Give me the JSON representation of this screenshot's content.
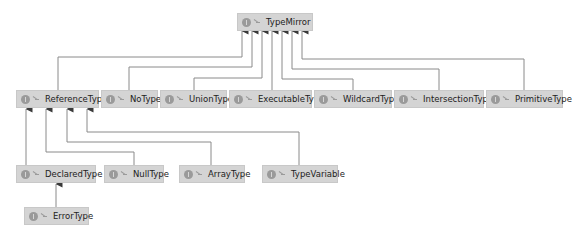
{
  "diagram": {
    "type": "class-hierarchy",
    "node_icon": "interface-icon",
    "visibility_icon": "public-visibility-icon",
    "colors": {
      "node_fill": "#d4d4d4",
      "node_border": "#c8c8c8",
      "edge": "#8a8a8a",
      "arrow": "#3a3a3a",
      "text": "#222222",
      "background": "#ffffff"
    },
    "nodes": {
      "typemirror": {
        "label": "TypeMirror"
      },
      "referencetype": {
        "label": "ReferenceType"
      },
      "notype": {
        "label": "NoType"
      },
      "uniontype": {
        "label": "UnionType"
      },
      "executabletype": {
        "label": "ExecutableType"
      },
      "wildcardtype": {
        "label": "WildcardType"
      },
      "intersectiontype": {
        "label": "IntersectionType"
      },
      "primitivetype": {
        "label": "PrimitiveType"
      },
      "declaredtype": {
        "label": "DeclaredType"
      },
      "nulltype": {
        "label": "NullType"
      },
      "arraytype": {
        "label": "ArrayType"
      },
      "typevariable": {
        "label": "TypeVariable"
      },
      "errortype": {
        "label": "ErrorType"
      }
    },
    "edges": [
      {
        "from": "ReferenceType",
        "to": "TypeMirror"
      },
      {
        "from": "NoType",
        "to": "TypeMirror"
      },
      {
        "from": "UnionType",
        "to": "TypeMirror"
      },
      {
        "from": "ExecutableType",
        "to": "TypeMirror"
      },
      {
        "from": "WildcardType",
        "to": "TypeMirror"
      },
      {
        "from": "IntersectionType",
        "to": "TypeMirror"
      },
      {
        "from": "PrimitiveType",
        "to": "TypeMirror"
      },
      {
        "from": "DeclaredType",
        "to": "ReferenceType"
      },
      {
        "from": "NullType",
        "to": "ReferenceType"
      },
      {
        "from": "ArrayType",
        "to": "ReferenceType"
      },
      {
        "from": "TypeVariable",
        "to": "ReferenceType"
      },
      {
        "from": "ErrorType",
        "to": "DeclaredType"
      }
    ]
  }
}
